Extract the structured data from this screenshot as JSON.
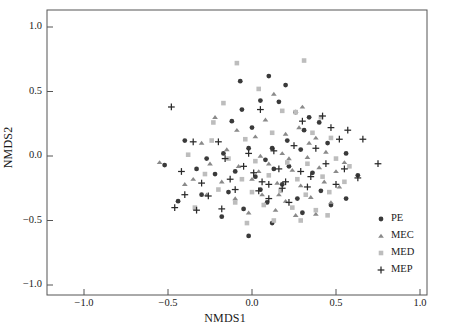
{
  "chart_data": {
    "type": "scatter",
    "title": "",
    "xlabel": "NMDS1",
    "ylabel": "NMDS2",
    "xlim": [
      -1.15,
      1.15
    ],
    "ylim": [
      -1.12,
      1.12
    ],
    "xticks": [
      -1.0,
      -0.5,
      0.0,
      0.5,
      1.0
    ],
    "yticks": [
      -1.0,
      -0.5,
      0.0,
      0.5,
      1.0
    ],
    "xtick_labels": [
      "-1.0",
      "-0.5",
      "0.0",
      "0.5",
      "1.0"
    ],
    "ytick_labels": [
      "-1.0",
      "-0.5",
      "0.0",
      "0.5",
      "1.0"
    ],
    "grid": false,
    "frame": true,
    "legend_position": "bottom-right",
    "series": [
      {
        "name": "PE",
        "marker": "circle",
        "color": "#3a3a3a",
        "points": [
          [
            -0.4,
            0.12
          ],
          [
            -0.52,
            -0.07
          ],
          [
            -0.07,
            0.58
          ],
          [
            0.1,
            0.62
          ],
          [
            0.2,
            0.55
          ],
          [
            0.05,
            0.43
          ],
          [
            0.16,
            0.42
          ],
          [
            0.26,
            0.34
          ],
          [
            -0.06,
            0.36
          ],
          [
            0.34,
            0.3
          ],
          [
            0.4,
            0.26
          ],
          [
            0.31,
            0.2
          ],
          [
            -0.12,
            0.27
          ],
          [
            0.0,
            0.22
          ],
          [
            -0.02,
            0.06
          ],
          [
            0.12,
            0.06
          ],
          [
            -0.17,
            0.02
          ],
          [
            0.08,
            -0.03
          ],
          [
            0.29,
            0.05
          ],
          [
            0.45,
            0.1
          ],
          [
            0.56,
            0.02
          ],
          [
            -0.27,
            -0.02
          ],
          [
            -0.33,
            -0.1
          ],
          [
            -0.22,
            -0.14
          ],
          [
            -0.1,
            -0.12
          ],
          [
            0.02,
            -0.16
          ],
          [
            0.13,
            -0.1
          ],
          [
            0.22,
            -0.08
          ],
          [
            0.36,
            -0.13
          ],
          [
            0.18,
            -0.22
          ],
          [
            0.05,
            -0.26
          ],
          [
            -0.14,
            -0.28
          ],
          [
            -0.3,
            -0.3
          ],
          [
            0.41,
            -0.27
          ],
          [
            0.27,
            -0.33
          ],
          [
            0.09,
            -0.36
          ],
          [
            -0.05,
            -0.41
          ],
          [
            0.3,
            -0.44
          ],
          [
            0.47,
            -0.38
          ],
          [
            -0.18,
            -0.47
          ],
          [
            0.12,
            -0.52
          ],
          [
            -0.02,
            -0.62
          ],
          [
            0.56,
            -0.33
          ],
          [
            0.21,
            0.12
          ],
          [
            -0.44,
            -0.35
          ],
          [
            0.63,
            -0.15
          ]
        ]
      },
      {
        "name": "MEC",
        "marker": "triangle",
        "color": "#8a8a8a",
        "points": [
          [
            -0.22,
            0.3
          ],
          [
            0.13,
            0.48
          ],
          [
            0.3,
            0.38
          ],
          [
            0.28,
            0.22
          ],
          [
            -0.09,
            0.2
          ],
          [
            0.02,
            0.15
          ],
          [
            0.2,
            0.17
          ],
          [
            0.38,
            0.14
          ],
          [
            -0.3,
            0.1
          ],
          [
            -0.15,
            0.05
          ],
          [
            0.05,
            0.0
          ],
          [
            0.18,
            0.02
          ],
          [
            0.33,
            -0.01
          ],
          [
            0.44,
            0.03
          ],
          [
            -0.25,
            -0.06
          ],
          [
            -0.08,
            -0.08
          ],
          [
            0.1,
            -0.06
          ],
          [
            0.24,
            -0.11
          ],
          [
            0.4,
            -0.09
          ],
          [
            0.5,
            -0.12
          ],
          [
            -0.35,
            -0.18
          ],
          [
            -0.18,
            -0.2
          ],
          [
            0.0,
            -0.18
          ],
          [
            0.15,
            -0.21
          ],
          [
            0.29,
            -0.23
          ],
          [
            0.43,
            -0.2
          ],
          [
            0.52,
            -0.24
          ],
          [
            -0.27,
            -0.3
          ],
          [
            -0.1,
            -0.33
          ],
          [
            0.06,
            -0.3
          ],
          [
            0.2,
            -0.35
          ],
          [
            0.35,
            -0.32
          ],
          [
            0.47,
            -0.36
          ],
          [
            -0.02,
            -0.44
          ],
          [
            0.14,
            -0.42
          ],
          [
            0.26,
            -0.46
          ],
          [
            0.38,
            -0.45
          ],
          [
            -0.55,
            -0.05
          ],
          [
            0.08,
            0.28
          ],
          [
            0.22,
            -0.02
          ],
          [
            0.34,
            0.1
          ],
          [
            0.04,
            -0.12
          ],
          [
            0.16,
            -0.3
          ],
          [
            -0.4,
            -0.22
          ],
          [
            0.55,
            -0.05
          ]
        ]
      },
      {
        "name": "MED",
        "marker": "square",
        "color": "#bdbdbd",
        "points": [
          [
            -0.09,
            0.72
          ],
          [
            0.31,
            0.74
          ],
          [
            0.04,
            0.52
          ],
          [
            -0.17,
            0.41
          ],
          [
            0.18,
            0.35
          ],
          [
            0.26,
            0.34
          ],
          [
            -0.23,
            0.26
          ],
          [
            0.41,
            0.3
          ],
          [
            -0.24,
            0.12
          ],
          [
            -0.04,
            0.13
          ],
          [
            0.12,
            0.18
          ],
          [
            0.36,
            0.18
          ],
          [
            0.47,
            0.14
          ],
          [
            -0.38,
            0.01
          ],
          [
            -0.14,
            -0.02
          ],
          [
            0.02,
            -0.04
          ],
          [
            0.21,
            -0.05
          ],
          [
            0.33,
            -0.06
          ],
          [
            0.5,
            -0.02
          ],
          [
            0.58,
            -0.08
          ],
          [
            -0.28,
            -0.14
          ],
          [
            -0.06,
            -0.18
          ],
          [
            0.1,
            -0.15
          ],
          [
            0.27,
            -0.18
          ],
          [
            0.42,
            -0.16
          ],
          [
            -0.2,
            -0.26
          ],
          [
            0.0,
            -0.28
          ],
          [
            0.17,
            -0.27
          ],
          [
            0.32,
            -0.3
          ],
          [
            0.46,
            -0.28
          ],
          [
            -0.1,
            -0.36
          ],
          [
            0.07,
            -0.38
          ],
          [
            0.24,
            -0.4
          ],
          [
            0.38,
            -0.42
          ],
          [
            -0.34,
            -0.4
          ],
          [
            0.13,
            -0.5
          ],
          [
            -0.03,
            -0.52
          ],
          [
            0.29,
            -0.5
          ],
          [
            0.45,
            -0.46
          ],
          [
            0.55,
            -0.2
          ]
        ]
      },
      {
        "name": "MEP",
        "marker": "plus",
        "color": "#2a2a2a",
        "points": [
          [
            -0.48,
            0.38
          ],
          [
            -0.35,
            0.11
          ],
          [
            -0.2,
            0.11
          ],
          [
            0.05,
            0.36
          ],
          [
            0.3,
            0.27
          ],
          [
            0.42,
            0.31
          ],
          [
            0.47,
            0.22
          ],
          [
            0.57,
            0.2
          ],
          [
            0.52,
            0.13
          ],
          [
            0.66,
            0.13
          ],
          [
            0.38,
            0.06
          ],
          [
            0.25,
            0.08
          ],
          [
            0.13,
            0.04
          ],
          [
            -0.02,
            0.02
          ],
          [
            -0.16,
            -0.02
          ],
          [
            -0.42,
            -0.12
          ],
          [
            -0.3,
            -0.21
          ],
          [
            -0.13,
            -0.18
          ],
          [
            0.01,
            -0.13
          ],
          [
            0.16,
            -0.1
          ],
          [
            0.29,
            -0.12
          ],
          [
            0.44,
            -0.06
          ],
          [
            0.55,
            -0.1
          ],
          [
            0.75,
            -0.06
          ],
          [
            0.63,
            -0.17
          ],
          [
            0.5,
            -0.22
          ],
          [
            0.33,
            -0.24
          ],
          [
            0.18,
            -0.25
          ],
          [
            0.04,
            -0.27
          ],
          [
            -0.1,
            -0.26
          ],
          [
            -0.26,
            -0.31
          ],
          [
            -0.4,
            -0.3
          ],
          [
            -0.46,
            -0.4
          ],
          [
            -0.33,
            -0.42
          ],
          [
            -0.18,
            -0.41
          ],
          [
            0.1,
            -0.33
          ],
          [
            0.22,
            -0.36
          ],
          [
            0.06,
            -0.2
          ],
          [
            0.2,
            -0.2
          ],
          [
            0.35,
            -0.16
          ],
          [
            -0.05,
            -0.08
          ],
          [
            0.1,
            -0.22
          ]
        ]
      }
    ]
  },
  "legend": {
    "entries": [
      {
        "label": "PE",
        "marker": "circle",
        "color": "#3a3a3a"
      },
      {
        "label": "MEC",
        "marker": "triangle",
        "color": "#8a8a8a"
      },
      {
        "label": "MED",
        "marker": "square",
        "color": "#bdbdbd"
      },
      {
        "label": "MEP",
        "marker": "plus",
        "color": "#2a2a2a"
      }
    ]
  }
}
